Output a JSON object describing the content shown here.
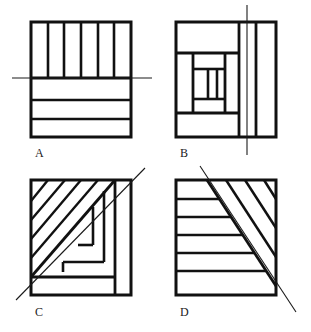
{
  "figure": {
    "background_color": "#ffffff",
    "stroke_color": "#111111",
    "axis_line_color": "#1a1a1a",
    "panel_count": 4
  },
  "panels": [
    {
      "id": "A",
      "label": "A",
      "pattern_name": "vertical-strips-over-horizontal-bands",
      "description": "Square divided into an upper band of six vertical strips and a lower region of three horizontal bands",
      "square": {
        "x": 31,
        "y": 22,
        "width": 100,
        "height": 115
      },
      "vertical_strip_count": 6,
      "horizontal_band_count": 3,
      "upper_band_bottom_y": 78,
      "symmetry_axis": {
        "type": "horizontal",
        "label": "horizontal-line",
        "x1": 12,
        "y1": 78,
        "x2": 152,
        "y2": 78
      },
      "label_position": {
        "x": 35,
        "y": 157
      }
    },
    {
      "id": "B",
      "label": "B",
      "pattern_name": "log-cabin-spiral",
      "description": "Square filled with nested concentric rectangular frames forming a spiral, plus right-hand vertical strips",
      "square": {
        "x": 176,
        "y": 22,
        "width": 100,
        "height": 115
      },
      "ring_count": 3,
      "symmetry_axis": {
        "type": "vertical",
        "label": "vertical-line",
        "x1": 247,
        "y1": 5,
        "x2": 247,
        "y2": 155
      },
      "label_position": {
        "x": 180,
        "y": 157
      }
    },
    {
      "id": "C",
      "label": "C",
      "pattern_name": "diagonal-stripes-with-spiral",
      "description": "Square with diagonal stripes in the upper-left triangle and a nested spiral in the lower-right",
      "square": {
        "x": 31,
        "y": 180,
        "width": 100,
        "height": 115
      },
      "diagonal_stripe_count": 5,
      "symmetry_axis": {
        "type": "diagonal-up",
        "label": "diagonal-line",
        "x1": 16,
        "y1": 300,
        "x2": 145,
        "y2": 168
      },
      "label_position": {
        "x": 35,
        "y": 316
      }
    },
    {
      "id": "D",
      "label": "D",
      "pattern_name": "horizontal-stripes-and-diagonal-stripes",
      "description": "Square split along the main diagonal: horizontal stripes in the lower-left triangle and diagonal stripes in the upper-right triangle",
      "square": {
        "x": 176,
        "y": 180,
        "width": 100,
        "height": 115
      },
      "horizontal_stripe_count": 6,
      "diagonal_stripe_count": 4,
      "symmetry_axis": {
        "type": "diagonal-down",
        "label": "diagonal-line",
        "x1": 200,
        "y1": 166,
        "x2": 296,
        "y2": 312
      },
      "label_position": {
        "x": 180,
        "y": 316
      }
    }
  ]
}
